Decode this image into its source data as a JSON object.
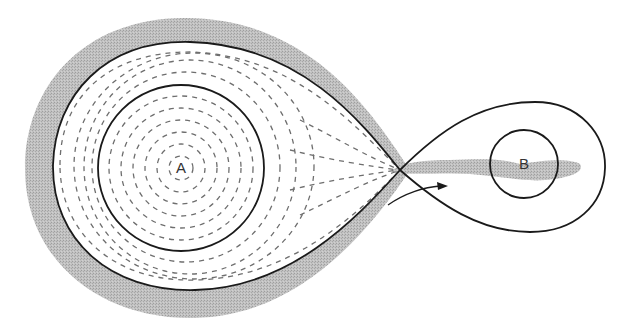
{
  "diagram": {
    "type": "binary-star-roche-lobe-mass-transfer",
    "labels": {
      "star_a": "A",
      "star_b": "B"
    },
    "elements": [
      {
        "id": "envelope",
        "description": "Gray shaded envelope surrounding the Roche lobe of star A"
      },
      {
        "id": "roche-lobe-a",
        "description": "Figure-eight Roche lobe boundary around star A (left lobe)"
      },
      {
        "id": "roche-lobe-b",
        "description": "Roche lobe boundary around star B (right lobe)"
      },
      {
        "id": "inner-lagrange-point",
        "description": "Crossing point L1 between the lobes"
      },
      {
        "id": "star-a-circle",
        "description": "Star A circle, filled with dashed flow lines"
      },
      {
        "id": "star-b-circle",
        "description": "Star B circle"
      },
      {
        "id": "mass-transfer-stream",
        "description": "Gray stream flowing from L1 toward and around star B"
      },
      {
        "id": "flow-arrow",
        "description": "Curved arrow indicating direction of flow toward B"
      }
    ],
    "colors": {
      "line": "#1a1a1a",
      "shade": "#b8b8b8",
      "dash": "#6e6e6e",
      "background": "#ffffff",
      "text": "#333333"
    }
  }
}
